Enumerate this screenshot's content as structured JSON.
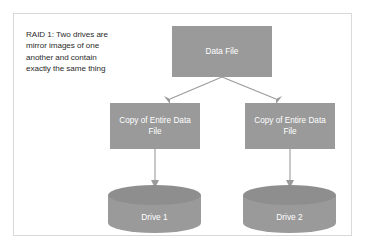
{
  "diagram": {
    "caption": "RAID 1: Two drives are mirror images of one another and contain exactly the same thing",
    "colors": {
      "node_fill": "#9a9a9a",
      "node_text": "#ffffff",
      "connector": "#9a9a9a",
      "frame_border": "#d9d9d9",
      "caption_text": "#2b2b2b",
      "background": "#ffffff"
    },
    "nodes": {
      "source": {
        "label": "Data File",
        "shape": "rectangle"
      },
      "copy_left": {
        "label": "Copy of Entire Data File",
        "shape": "rectangle"
      },
      "copy_right": {
        "label": "Copy of Entire Data File",
        "shape": "rectangle"
      },
      "drive_left": {
        "label": "Drive 1",
        "shape": "cylinder"
      },
      "drive_right": {
        "label": "Drive 2",
        "shape": "cylinder"
      }
    },
    "edges": [
      {
        "from": "Data File",
        "to": "Copy of Entire Data File (left)",
        "style": "arrow"
      },
      {
        "from": "Data File",
        "to": "Copy of Entire Data File (right)",
        "style": "arrow"
      },
      {
        "from": "Copy of Entire Data File (left)",
        "to": "Drive 1",
        "style": "arrow"
      },
      {
        "from": "Copy of Entire Data File (right)",
        "to": "Drive 2",
        "style": "arrow"
      }
    ]
  }
}
